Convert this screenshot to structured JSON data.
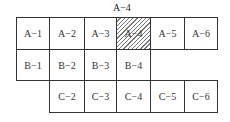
{
  "top_label": "A−4",
  "highlighted": "A−4",
  "rows": [
    {
      "row": "A",
      "cells": [
        "A−1",
        "A−2",
        "A−3",
        "A−4",
        "A−5",
        "A−6"
      ]
    },
    {
      "row": "B",
      "cells": [
        "B−1",
        "B−2",
        "B−3",
        "B−4"
      ]
    },
    {
      "row": "C",
      "cells": [
        "C−2",
        "C−3",
        "C−4",
        "C−5",
        "C−6"
      ]
    }
  ]
}
